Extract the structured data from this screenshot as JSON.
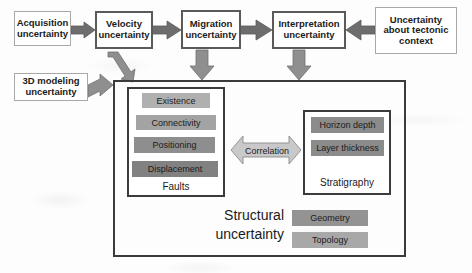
{
  "diagram": {
    "title_caption": "Structural uncertainty",
    "chain": [
      {
        "id": "acquisition",
        "label": "Acquisition uncertainty",
        "style": "thin"
      },
      {
        "id": "velocity",
        "label": "Velocity uncertainty",
        "style": "thick"
      },
      {
        "id": "migration",
        "label": "Migration uncertainty",
        "style": "thick"
      },
      {
        "id": "interpretation",
        "label": "Interpretation uncertainty",
        "style": "thick"
      },
      {
        "id": "tectonic",
        "label": "Uncertainty about tectonic context",
        "style": "thin"
      }
    ],
    "side_inputs": [
      {
        "id": "modeling3d",
        "label": "3D modeling uncertainty",
        "style": "thin"
      }
    ],
    "faults": {
      "caption": "Faults",
      "chips": [
        {
          "label": "Existence",
          "color": "#b0b0b0"
        },
        {
          "label": "Connectivity",
          "color": "#a3a3a3"
        },
        {
          "label": "Positioning",
          "color": "#8e8e8e"
        },
        {
          "label": "Displacement",
          "color": "#818181"
        }
      ]
    },
    "stratigraphy": {
      "caption": "Stratigraphy",
      "chips": [
        {
          "label": "Horizon depth",
          "color": "#8b8b8b"
        },
        {
          "label": "Layer thickness",
          "color": "#8b8b8b"
        }
      ]
    },
    "structural": {
      "caption_line1": "Structural",
      "caption_line2": "uncertainty",
      "chips": [
        {
          "label": "Geometry",
          "color": "#939393"
        },
        {
          "label": "Topology",
          "color": "#a8a8a8"
        }
      ]
    },
    "correlation": {
      "label": "Correlation",
      "icon": "double-headed-arrow-icon"
    },
    "arrows": {
      "acquisition_to_velocity": "right-arrow-icon",
      "velocity_to_migration": "right-arrow-icon",
      "migration_to_interpretation": "right-arrow-icon",
      "tectonic_to_interpretation": "left-arrow-icon",
      "velocity_down": "down-arrow-icon",
      "migration_down": "down-arrow-icon",
      "interpretation_down": "down-arrow-icon",
      "modeling3d_into_panel": "down-right-arrow-icon"
    },
    "colors": {
      "panel_border": "#3b3b3b",
      "thick_border": "#5a5a5a",
      "thin_border": "#a8a8a8",
      "arrow_fill": "#8f8f8f",
      "arrow_light_fill": "#c9c9c9",
      "text": "#1b1b1b",
      "background": "#fdfdfd"
    }
  }
}
